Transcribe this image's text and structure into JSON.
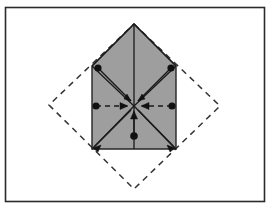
{
  "figure": {
    "canvas": {
      "width": 273,
      "height": 215,
      "background": "#ffffff"
    },
    "frame": {
      "label": "figure border",
      "x": 5.5,
      "y": 7.5,
      "width": 259,
      "height": 194,
      "stroke": "#2b2b2b",
      "stroke_width": 1.6,
      "fill": "none"
    },
    "shaded_polygon": {
      "label": "pentagon house shape",
      "points": "134,24 176,66 176,149 92,149 92,66",
      "fill": "#9e9e9e",
      "stroke": "#262626",
      "stroke_width": 1.4
    },
    "dashed_diamond": {
      "label": "rotated square outline",
      "points": "134,24 220,106 134,189 49,105",
      "fill": "none",
      "stroke": "#333333",
      "stroke_width": 1.5,
      "dash": "6 5"
    },
    "center_point": {
      "label": "center of symmetry",
      "x": 134,
      "y": 106
    },
    "fold_lines": [
      {
        "name": "vertical-crease",
        "x1": 134,
        "y1": 24,
        "x2": 134,
        "y2": 149,
        "stroke": "#1a1a1a",
        "width": 1.3
      },
      {
        "name": "roof-left-crease",
        "x1": 134,
        "y1": 24,
        "x2": 92,
        "y2": 66,
        "stroke": "#1a1a1a",
        "width": 1.3
      },
      {
        "name": "roof-right-crease",
        "x1": 134,
        "y1": 24,
        "x2": 176,
        "y2": 66,
        "stroke": "#1a1a1a",
        "width": 1.3
      },
      {
        "name": "diagonal-bl-crease",
        "x1": 134,
        "y1": 106,
        "x2": 92,
        "y2": 149,
        "stroke": "#1a1a1a",
        "width": 1.3
      },
      {
        "name": "diagonal-br-crease",
        "x1": 134,
        "y1": 106,
        "x2": 176,
        "y2": 149,
        "stroke": "#1a1a1a",
        "width": 1.3
      },
      {
        "name": "diagonal-tl-crease",
        "x1": 134,
        "y1": 106,
        "x2": 92,
        "y2": 66,
        "stroke": "#1a1a1a",
        "width": 1.3
      },
      {
        "name": "diagonal-tr-crease",
        "x1": 134,
        "y1": 106,
        "x2": 176,
        "y2": 66,
        "stroke": "#1a1a1a",
        "width": 1.3
      }
    ],
    "arrows": [
      {
        "name": "arrow-from-upper-left",
        "direction": "down-right",
        "dot": {
          "x": 98,
          "y": 68
        },
        "tip": {
          "x": 131,
          "y": 101
        },
        "style": "solid",
        "stroke": "#1a1a1a",
        "width": 1.5
      },
      {
        "name": "arrow-from-upper-right",
        "direction": "down-left",
        "dot": {
          "x": 171,
          "y": 68
        },
        "tip": {
          "x": 138,
          "y": 101
        },
        "style": "solid",
        "stroke": "#1a1a1a",
        "width": 1.5
      },
      {
        "name": "arrow-from-left",
        "direction": "right",
        "dot": {
          "x": 96,
          "y": 106
        },
        "tip": {
          "x": 127,
          "y": 106
        },
        "style": "dashed",
        "stroke": "#1a1a1a",
        "width": 1.6
      },
      {
        "name": "arrow-from-right",
        "direction": "left",
        "dot": {
          "x": 172,
          "y": 106
        },
        "tip": {
          "x": 142,
          "y": 106
        },
        "style": "dashed",
        "stroke": "#1a1a1a",
        "width": 1.6
      },
      {
        "name": "arrow-from-below",
        "direction": "up",
        "dot": {
          "x": 134,
          "y": 136
        },
        "tip": {
          "x": 134,
          "y": 112
        },
        "style": "solid",
        "stroke": "#1a1a1a",
        "width": 1.4
      },
      {
        "name": "arrow-to-lower-left-corner",
        "direction": "down-left",
        "dot": {
          "x": 131,
          "y": 110
        },
        "tip": {
          "x": 94,
          "y": 147
        },
        "style": "solid",
        "stroke": "#1a1a1a",
        "width": 1.5
      },
      {
        "name": "arrow-to-lower-right-corner",
        "direction": "down-right",
        "dot": {
          "x": 138,
          "y": 110
        },
        "tip": {
          "x": 174,
          "y": 147
        },
        "style": "solid",
        "stroke": "#1a1a1a",
        "width": 1.5
      }
    ],
    "dot_markers": [
      {
        "name": "dot-upper-left",
        "x": 98,
        "y": 68,
        "r": 3.6,
        "fill": "#111111"
      },
      {
        "name": "dot-upper-right",
        "x": 171,
        "y": 68,
        "r": 3.6,
        "fill": "#111111"
      },
      {
        "name": "dot-mid-left",
        "x": 96,
        "y": 106,
        "r": 3.6,
        "fill": "#111111"
      },
      {
        "name": "dot-mid-right",
        "x": 172,
        "y": 106,
        "r": 3.6,
        "fill": "#111111"
      },
      {
        "name": "dot-bottom-center",
        "x": 134,
        "y": 136,
        "r": 3.8,
        "fill": "#111111"
      }
    ],
    "arrowheads": [
      {
        "name": "head-center-from-upper-left",
        "points": "131,101 124,99 127,94",
        "fill": "#111111"
      },
      {
        "name": "head-center-from-upper-right",
        "points": "138,101 145,99 142,94",
        "fill": "#111111"
      },
      {
        "name": "head-center-from-left",
        "points": "128,106 120,102.5 120,109.5",
        "fill": "#111111"
      },
      {
        "name": "head-center-from-right",
        "points": "141,106 149,102.5 149,109.5",
        "fill": "#111111"
      },
      {
        "name": "head-center-from-below",
        "points": "134,111 130.5,119 137.5,119",
        "fill": "#111111"
      },
      {
        "name": "head-lower-left",
        "points": "93,148 101,145 98,152",
        "fill": "#111111"
      },
      {
        "name": "head-lower-right",
        "points": "175,148 167,145 170,152",
        "fill": "#111111"
      }
    ]
  }
}
